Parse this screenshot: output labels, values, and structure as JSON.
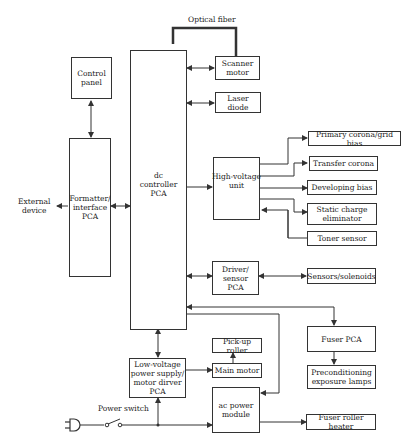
{
  "diagram": {
    "type": "block-diagram",
    "labels": {
      "optical_fiber": "Optical fiber",
      "external_device": "External\ndevice",
      "power_switch": "Power switch"
    },
    "blocks": {
      "control_panel": "Control\npanel",
      "formatter": "Formatter/\ninterface\nPCA",
      "dc_controller": "dc\ncontroller\nPCA",
      "scanner_motor": "Scanner\nmotor",
      "laser_diode": "Laser diode",
      "high_voltage": "High-voltage\nunit",
      "primary_corona": "Primary corona/grid bias",
      "transfer_corona": "Transfer corona",
      "developing_bias": "Developing bias",
      "static_charge": "Static charge\neliminator",
      "toner_sensor": "Toner sensor",
      "driver_sensor": "Driver/\nsensor\nPCA",
      "sensors_solenoids": "Sensors/solenoids",
      "fuser_pca": "Fuser PCA",
      "preconditioning": "Preconditioning\nexposure lamps",
      "pickup_roller": "Pick-up roller",
      "main_motor": "Main motor",
      "low_voltage": "Low-voltage\npower supply/\nmotor dirver\nPCA",
      "ac_power": "ac power\nmodule",
      "fuser_heater": "Fuser roller heater"
    }
  }
}
